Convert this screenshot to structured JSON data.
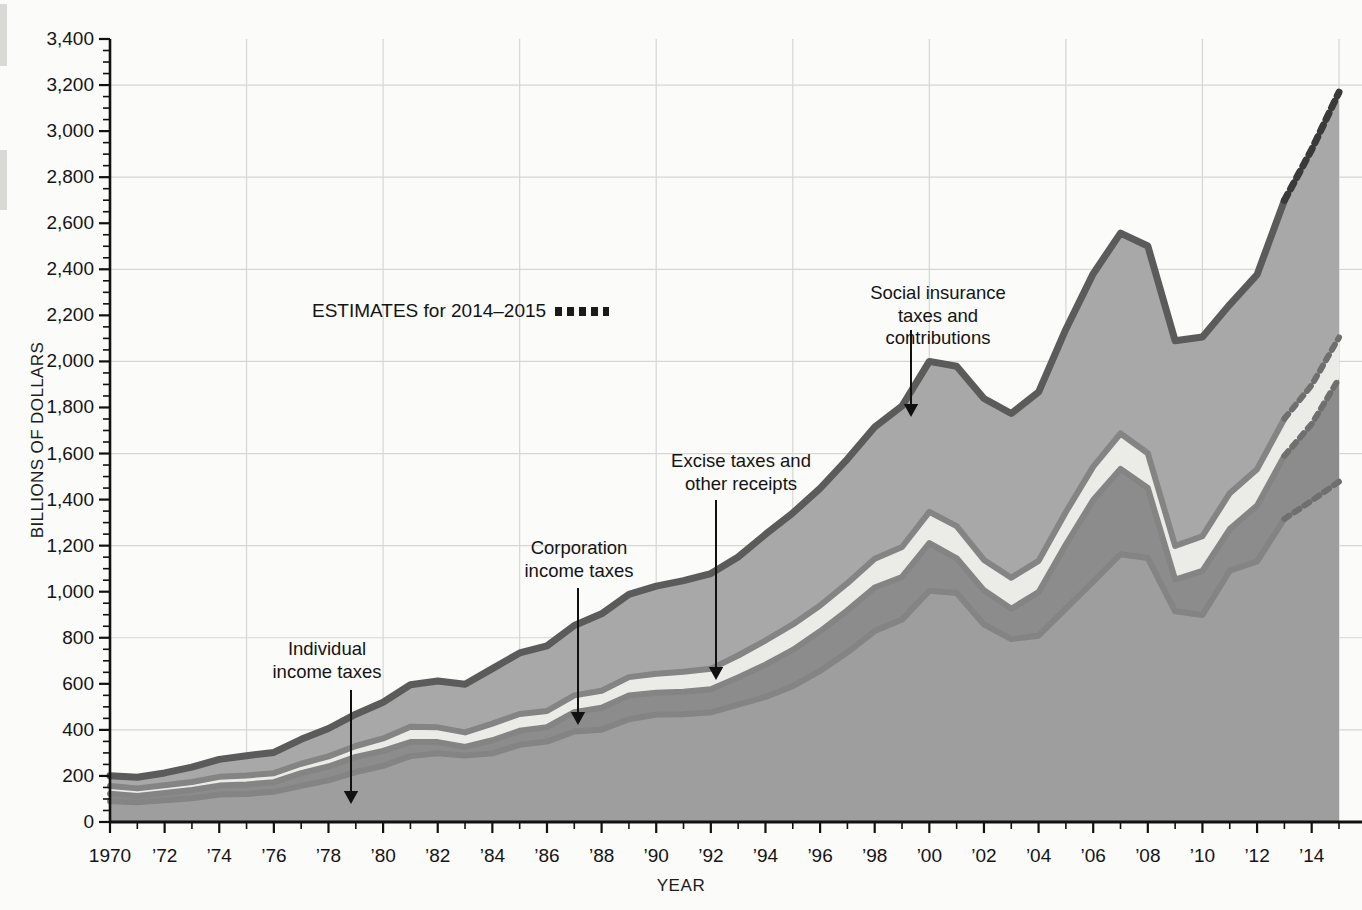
{
  "chart_data": {
    "type": "area",
    "title": "",
    "xlabel": "YEAR",
    "ylabel": "BILLIONS OF DOLLARS",
    "ylim": [
      0,
      3400
    ],
    "xlim": [
      1970,
      2015
    ],
    "ytick_step": 200,
    "grid": true,
    "legend_position": "annotations-inline",
    "stacked": true,
    "estimate_note": "ESTIMATES for 2014–2015",
    "estimate_years": [
      2014,
      2015
    ],
    "x": [
      1970,
      1971,
      1972,
      1973,
      1974,
      1975,
      1976,
      1977,
      1978,
      1979,
      1980,
      1981,
      1982,
      1983,
      1984,
      1985,
      1986,
      1987,
      1988,
      1989,
      1990,
      1991,
      1992,
      1993,
      1994,
      1995,
      1996,
      1997,
      1998,
      1999,
      2000,
      2001,
      2002,
      2003,
      2004,
      2005,
      2006,
      2007,
      2008,
      2009,
      2010,
      2011,
      2012,
      2013,
      2014,
      2015
    ],
    "xtick_labels": [
      "1970",
      "’72",
      "’74",
      "’76",
      "’78",
      "’80",
      "’82",
      "’84",
      "’86",
      "’88",
      "’90",
      "’92",
      "’94",
      "’96",
      "’98",
      "’00",
      "’02",
      "’04",
      "’06",
      "’08",
      "’10",
      "’12",
      "’14"
    ],
    "ytick_labels": [
      "0",
      "200",
      "400",
      "600",
      "800",
      "1,000",
      "1,200",
      "1,400",
      "1,600",
      "1,800",
      "2,000",
      "2,200",
      "2,400",
      "2,600",
      "2,800",
      "3,000",
      "3,200",
      "3,400"
    ],
    "series": [
      {
        "name": "Individual income taxes",
        "color": "#9e9e9e",
        "values": [
          90,
          86,
          94,
          103,
          119,
          122,
          131,
          157,
          181,
          217,
          244,
          286,
          298,
          289,
          298,
          335,
          349,
          393,
          401,
          446,
          467,
          468,
          476,
          510,
          543,
          590,
          656,
          737,
          829,
          879,
          1004,
          994,
          858,
          794,
          809,
          927,
          1044,
          1163,
          1146,
          915,
          899,
          1091,
          1132,
          1316,
          1395,
          1478
        ]
      },
      {
        "name": "Corporation income taxes",
        "color": "#8c8c8c",
        "values": [
          33,
          27,
          32,
          36,
          39,
          41,
          42,
          55,
          60,
          66,
          65,
          61,
          49,
          37,
          57,
          61,
          63,
          84,
          95,
          103,
          94,
          98,
          100,
          118,
          140,
          157,
          172,
          182,
          189,
          185,
          207,
          151,
          148,
          132,
          189,
          278,
          354,
          370,
          304,
          138,
          191,
          181,
          242,
          274,
          333,
          448
        ]
      },
      {
        "name": "Excise taxes and other receipts",
        "color": "#ebebe8",
        "values": [
          33,
          33,
          34,
          35,
          38,
          39,
          39,
          41,
          44,
          47,
          54,
          67,
          64,
          63,
          72,
          73,
          70,
          73,
          74,
          80,
          83,
          86,
          89,
          95,
          105,
          111,
          112,
          118,
          125,
          130,
          136,
          140,
          132,
          135,
          136,
          141,
          145,
          154,
          151,
          146,
          151,
          156,
          158,
          161,
          169,
          178
        ]
      },
      {
        "name": "Social insurance taxes and contributions",
        "color": "#a8a8a8",
        "values": [
          45,
          48,
          53,
          64,
          76,
          86,
          90,
          106,
          121,
          138,
          157,
          182,
          201,
          209,
          239,
          265,
          283,
          303,
          334,
          359,
          380,
          396,
          414,
          428,
          461,
          484,
          509,
          539,
          572,
          612,
          653,
          694,
          701,
          713,
          733,
          794,
          838,
          870,
          900,
          891,
          865,
          819,
          845,
          948,
          1023,
          1065
        ]
      }
    ],
    "totals": [
      201,
      194,
      213,
      238,
      272,
      288,
      302,
      359,
      406,
      468,
      520,
      596,
      612,
      598,
      666,
      734,
      765,
      853,
      904,
      988,
      1024,
      1048,
      1079,
      1151,
      1249,
      1342,
      1449,
      1576,
      1715,
      1806,
      2000,
      1979,
      1839,
      1774,
      1867,
      2140,
      2381,
      2557,
      2501,
      2090,
      2106,
      2247,
      2377,
      2699,
      2920,
      3169
    ]
  },
  "annotations": {
    "individual": "Individual\nincome taxes",
    "corporation": "Corporation\nincome taxes",
    "excise": "Excise taxes and\nother receipts",
    "social": "Social insurance\ntaxes and\ncontributions",
    "estimates": "ESTIMATES for 2014–2015"
  },
  "axis": {
    "y_title": "BILLIONS OF DOLLARS",
    "x_title": "YEAR"
  }
}
